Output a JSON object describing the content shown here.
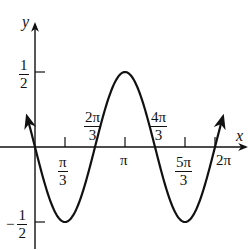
{
  "chart_data": {
    "type": "line",
    "title": "",
    "function": "y = -1/2 sin(3x/2)",
    "xlabel": "x",
    "ylabel": "y",
    "xlim": [
      -0.35,
      6.6
    ],
    "ylim": [
      -0.65,
      0.65
    ],
    "grid": false,
    "legend": null,
    "x_ticks": [
      {
        "value": 1.0472,
        "label_num": "π",
        "label_den": "3"
      },
      {
        "value": 2.0944,
        "label_num": "2π",
        "label_den": "3"
      },
      {
        "value": 3.1416,
        "label": "π"
      },
      {
        "value": 4.1888,
        "label_num": "4π",
        "label_den": "3"
      },
      {
        "value": 5.236,
        "label_num": "5π",
        "label_den": "3"
      },
      {
        "value": 6.2832,
        "label": "2π"
      }
    ],
    "y_ticks": [
      {
        "value": 0.5,
        "label_num": "1",
        "label_den": "2"
      },
      {
        "value": -0.5,
        "label_sign": "−",
        "label_num": "1",
        "label_den": "2"
      }
    ],
    "key_points": [
      {
        "x": 0,
        "y": 0
      },
      {
        "x": 1.0472,
        "y": -0.5
      },
      {
        "x": 2.0944,
        "y": 0
      },
      {
        "x": 3.1416,
        "y": 0.5
      },
      {
        "x": 4.1888,
        "y": 0
      },
      {
        "x": 5.236,
        "y": -0.5
      },
      {
        "x": 6.2832,
        "y": 0
      }
    ],
    "curve_ends": "arrows at both ends (x ≈ -0.28 and x ≈ 6.56)",
    "stroke_color": "#111111"
  },
  "labels": {
    "x_axis": "x",
    "y_axis": "y",
    "pi": "π",
    "two_pi": "2π",
    "pi_over_3_num": "π",
    "two_pi_over_3_num": "2π",
    "four_pi_over_3_num": "4π",
    "five_pi_over_3_num": "5π",
    "three": "3",
    "one": "1",
    "two": "2",
    "minus": "−"
  }
}
